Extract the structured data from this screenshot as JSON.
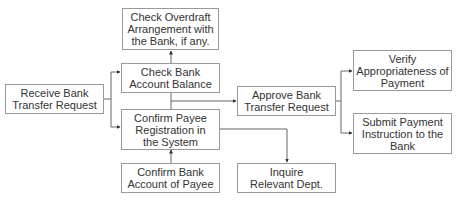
{
  "diagram": {
    "type": "flowchart",
    "nodes": [
      {
        "id": "receive",
        "label": "Receive Bank\nTransfer Request"
      },
      {
        "id": "overdraft",
        "label": "Check Overdraft\nArrangement with\nthe Bank, if any."
      },
      {
        "id": "check_balance",
        "label": "Check Bank\nAccount Balance"
      },
      {
        "id": "confirm_payee",
        "label": "Confirm Payee\nRegistration in\nthe System"
      },
      {
        "id": "confirm_account",
        "label": "Confirm Bank\nAccount of Payee"
      },
      {
        "id": "approve",
        "label": "Approve Bank\nTransfer Request"
      },
      {
        "id": "inquire",
        "label": "Inquire\nRelevant Dept."
      },
      {
        "id": "verify",
        "label": "Verify\nAppropriateness of\nPayment"
      },
      {
        "id": "submit",
        "label": "Submit Payment\nInstruction to the\nBank"
      }
    ],
    "edges": [
      {
        "from": "receive",
        "to": "check_balance"
      },
      {
        "from": "receive",
        "to": "confirm_payee"
      },
      {
        "from": "check_balance",
        "to": "overdraft"
      },
      {
        "from": "confirm_account",
        "to": "confirm_payee"
      },
      {
        "from": "check_balance",
        "to": "approve"
      },
      {
        "from": "confirm_payee",
        "to": "approve"
      },
      {
        "from": "confirm_payee",
        "to": "inquire"
      },
      {
        "from": "approve",
        "to": "verify"
      },
      {
        "from": "approve",
        "to": "submit"
      }
    ],
    "colors": {
      "line": "#555555",
      "border": "#9a9a9a",
      "text": "#333333"
    }
  }
}
